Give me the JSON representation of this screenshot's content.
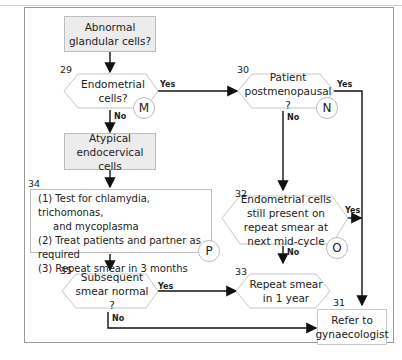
{
  "nodes": {
    "start": {
      "text": "Abnormal glandular cells?"
    },
    "n29": {
      "number": "29",
      "text": "Endometrial cells?",
      "marker": "M"
    },
    "n30": {
      "number": "30",
      "text": "Patient postmenopausal ?",
      "marker": "N"
    },
    "atypical": {
      "text": "Atypical endocervical cells"
    },
    "n34": {
      "number": "34",
      "items": [
        "(1) Test for chlamydia, trichomonas,",
        "and mycoplasma",
        "(2) Treat patients and partner as required",
        "(3) Repeat smear in 3 months"
      ],
      "marker": "P"
    },
    "n32": {
      "number": "32",
      "text": "Endometrial cells still present on repeat smear at next mid-cycle",
      "marker": "O"
    },
    "n35": {
      "number": "35",
      "text": "Subsequent smear normal ?"
    },
    "n33": {
      "number": "33",
      "text": "Repeat smear in 1 year"
    },
    "n31": {
      "number": "31",
      "text": "Refer to gynaecologist"
    }
  },
  "edges": {
    "yes": "Yes",
    "no": "No"
  }
}
